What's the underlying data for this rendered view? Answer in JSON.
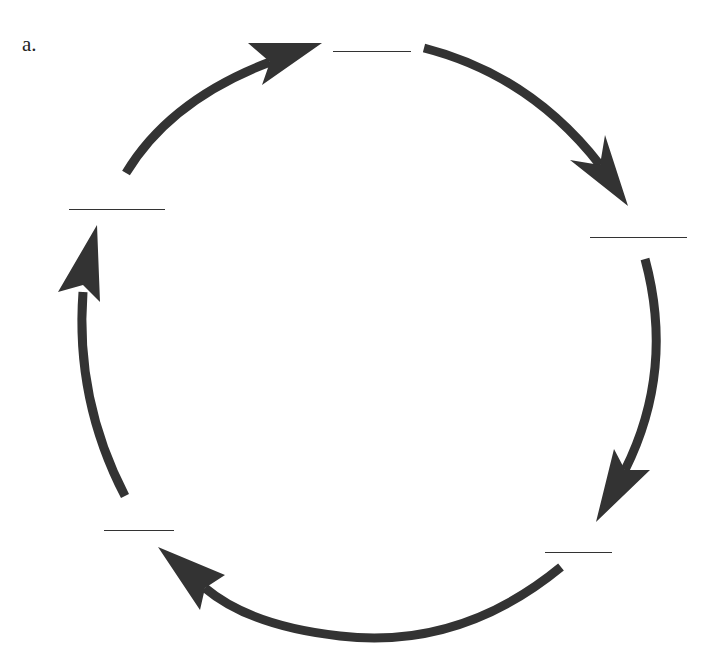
{
  "diagram": {
    "label": "a.",
    "type": "cycle",
    "direction": "clockwise",
    "arrow_color": "#333333",
    "blank_color": "#333333",
    "nodes": [
      {
        "id": "top",
        "text": "",
        "blank": true
      },
      {
        "id": "right",
        "text": "",
        "blank": true
      },
      {
        "id": "bottom-right",
        "text": "",
        "blank": true
      },
      {
        "id": "bottom-left",
        "text": "",
        "blank": true
      },
      {
        "id": "left",
        "text": "",
        "blank": true
      }
    ],
    "edges": [
      {
        "from": "left",
        "to": "top"
      },
      {
        "from": "top",
        "to": "right"
      },
      {
        "from": "right",
        "to": "bottom-right"
      },
      {
        "from": "bottom-right",
        "to": "bottom-left"
      },
      {
        "from": "bottom-left",
        "to": "left"
      }
    ]
  }
}
